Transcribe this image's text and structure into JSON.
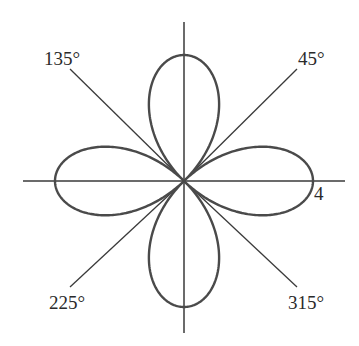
{
  "figure": {
    "equation": "r = 4 cos(2θ)",
    "max_radius": 4,
    "petals": 4,
    "colors": {
      "curve": "#4a4a4a",
      "axes": "#3a3a3a",
      "text": "#2a2a2a",
      "background": "#ffffff"
    }
  },
  "labels": {
    "angle_45": "45°",
    "angle_135": "135°",
    "angle_225": "225°",
    "angle_315": "315°",
    "radius_tick": "4"
  },
  "axes": {
    "reference_lines": [
      "0°/180° (horizontal)",
      "90°/270° (vertical)",
      "45°/225°",
      "135°/315°"
    ]
  }
}
